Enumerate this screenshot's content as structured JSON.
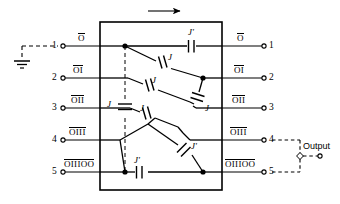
{
  "diagram": {
    "title_arrow": "direction-arrow-right",
    "box": {
      "x": 100,
      "y": 22,
      "w": 122,
      "h": 168
    },
    "left_terminals": [
      {
        "num": "1",
        "label": "O",
        "overline": true,
        "y": 46
      },
      {
        "num": "2",
        "label": "OI",
        "overline": true,
        "y": 78
      },
      {
        "num": "3",
        "label": "OII",
        "overline": true,
        "y": 108
      },
      {
        "num": "4",
        "label": "OIII",
        "overline": true,
        "y": 140
      },
      {
        "num": "5",
        "label": "OIIIOO",
        "overline": true,
        "y": 172
      }
    ],
    "right_terminals": [
      {
        "num": "1",
        "label": "O",
        "overline": true,
        "y": 46
      },
      {
        "num": "2",
        "label": "OI",
        "overline": true,
        "y": 78
      },
      {
        "num": "3",
        "label": "OII",
        "overline": true,
        "y": 108
      },
      {
        "num": "4",
        "label": "OIII",
        "overline": true,
        "y": 140
      },
      {
        "num": "5",
        "label": "OIIIOO",
        "overline": true,
        "y": 172
      }
    ],
    "capacitors": [
      {
        "name": "cap-top-right",
        "label": "J'"
      },
      {
        "name": "cap-r1-r2-upper",
        "label": "J"
      },
      {
        "name": "cap-r2-diag",
        "label": "J"
      },
      {
        "name": "cap-r2-r3-vert",
        "label": "J"
      },
      {
        "name": "cap-mid-dashed",
        "label": "J"
      },
      {
        "name": "cap-r3-diag",
        "label": "J"
      },
      {
        "name": "cap-r4-diag",
        "label": "J'"
      },
      {
        "name": "cap-bottom-row",
        "label": "J'"
      }
    ],
    "output": {
      "label": "Output"
    },
    "ground": {
      "name": "ground-symbol"
    }
  }
}
